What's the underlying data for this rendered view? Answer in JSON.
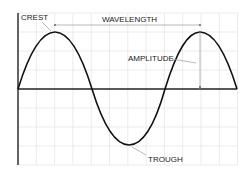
{
  "diagram": {
    "labels": {
      "crest": "CREST",
      "wavelength": "WAVELENGTH",
      "amplitude": "AMPLITUDE",
      "trough": "TROUGH"
    },
    "colors": {
      "background": "#ffffff",
      "grid": "#e6e6e6",
      "axis": "#222222",
      "wave": "#111111",
      "leader": "#999999"
    },
    "geometry": {
      "axis_left_x": 18,
      "axis_top_y": 13,
      "axis_bottom_y": 165,
      "baseline_y": 89,
      "baseline_right_x": 237,
      "crest_1": [
        55,
        32
      ],
      "zero_1": [
        92,
        89
      ],
      "trough": [
        129,
        145
      ],
      "zero_2": [
        165,
        89
      ],
      "crest_2": [
        200,
        32
      ],
      "end": [
        237,
        89
      ]
    }
  }
}
